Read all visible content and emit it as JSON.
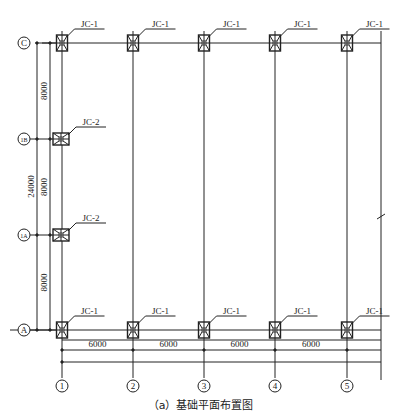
{
  "drawing": {
    "caption": "（a）基础平面布置图",
    "line_color": "#222222",
    "columns_axes": [
      {
        "label": "1",
        "x": 62
      },
      {
        "label": "2",
        "x": 133
      },
      {
        "label": "3",
        "x": 204
      },
      {
        "label": "4",
        "x": 275
      },
      {
        "label": "5",
        "x": 347
      }
    ],
    "row_axes": [
      {
        "label": "C",
        "y": 43
      },
      {
        "label": "1/B",
        "y": 139
      },
      {
        "label": "1/A",
        "y": 235
      },
      {
        "label": "A",
        "y": 330
      }
    ],
    "footings": [
      {
        "type": "JC-1",
        "axis_x": "1",
        "axis_y": "C"
      },
      {
        "type": "JC-1",
        "axis_x": "2",
        "axis_y": "C"
      },
      {
        "type": "JC-1",
        "axis_x": "3",
        "axis_y": "C"
      },
      {
        "type": "JC-1",
        "axis_x": "4",
        "axis_y": "C"
      },
      {
        "type": "JC-1",
        "axis_x": "5",
        "axis_y": "C"
      },
      {
        "type": "JC-2",
        "axis_x": "1",
        "axis_y": "1/B"
      },
      {
        "type": "JC-2",
        "axis_x": "1",
        "axis_y": "1/A"
      },
      {
        "type": "JC-1",
        "axis_x": "1",
        "axis_y": "A"
      },
      {
        "type": "JC-1",
        "axis_x": "2",
        "axis_y": "A"
      },
      {
        "type": "JC-1",
        "axis_x": "3",
        "axis_y": "A"
      },
      {
        "type": "JC-1",
        "axis_x": "4",
        "axis_y": "A"
      },
      {
        "type": "JC-1",
        "axis_x": "5",
        "axis_y": "A"
      }
    ],
    "dimensions": {
      "horizontal": [
        "6000",
        "6000",
        "6000",
        "6000"
      ],
      "vertical_segments": [
        "8000",
        "8000",
        "8000"
      ],
      "vertical_total": "24000"
    }
  }
}
